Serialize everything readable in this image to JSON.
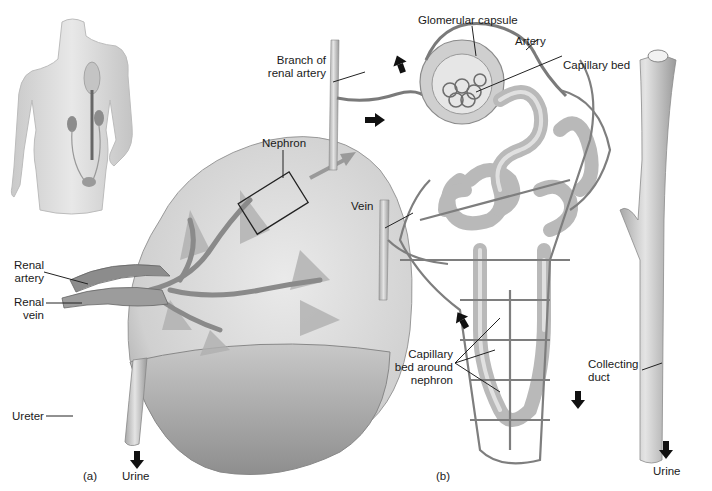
{
  "figure": {
    "panel_a": {
      "tag": "(a)",
      "labels": {
        "renal_artery": [
          "Renal",
          "artery"
        ],
        "renal_vein": [
          "Renal",
          "vein"
        ],
        "ureter": "Ureter",
        "nephron": "Nephron",
        "urine": "Urine"
      }
    },
    "panel_b": {
      "tag": "(b)",
      "labels": {
        "glomerular_capsule": "Glomerular capsule",
        "artery": "Artery",
        "capillary_bed": "Capillary bed",
        "branch_of_renal_artery": [
          "Branch of",
          "renal artery"
        ],
        "vein": "Vein",
        "capillary_bed_around_nephron": [
          "Capillary",
          "bed around",
          "nephron"
        ],
        "collecting_duct": [
          "Collecting",
          "duct"
        ],
        "urine": "Urine"
      }
    },
    "colors": {
      "tissue_light": "#dcdcdc",
      "tissue_mid": "#b5b5b5",
      "tissue_dark": "#8a8a8a",
      "vessel": "#7a7a7a",
      "arrow": "#111111",
      "leader": "#222222"
    }
  }
}
